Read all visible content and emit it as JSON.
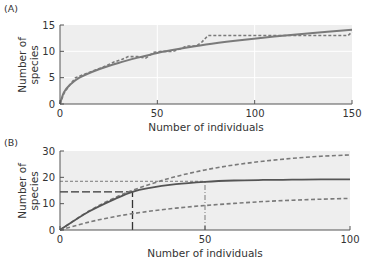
{
  "chart_data": [
    {
      "panel": "(A)",
      "type": "line",
      "xlabel": "Number of individuals",
      "ylabel": [
        "Number of",
        "species"
      ],
      "xlim": [
        0,
        150
      ],
      "ylim": [
        0,
        15
      ],
      "xticks": [
        "0",
        "50",
        "100",
        "150"
      ],
      "yticks": [
        "0",
        "5",
        "10",
        "15"
      ],
      "grid": true,
      "series": [
        {
          "name": "rarefaction curve (solid)",
          "style": "solid",
          "x": [
            0,
            2,
            5,
            10,
            20,
            30,
            40,
            50,
            60,
            75,
            90,
            110,
            130,
            150
          ],
          "y": [
            0,
            2.2,
            3.6,
            5.0,
            6.6,
            7.8,
            8.8,
            9.7,
            10.4,
            11.3,
            12.0,
            12.8,
            13.5,
            14.1
          ]
        },
        {
          "name": "observed accumulation (dashed)",
          "style": "dashed",
          "x": [
            0,
            2,
            5,
            8,
            15,
            22,
            28,
            32,
            35,
            40,
            44,
            48,
            52,
            58,
            62,
            65,
            70,
            73,
            76,
            80,
            100,
            120,
            148,
            150
          ],
          "y": [
            0,
            2.0,
            3.6,
            5.0,
            6.0,
            7.0,
            8.0,
            8.5,
            9.0,
            9.0,
            8.7,
            9.8,
            10.0,
            10.0,
            10.5,
            11.0,
            11.0,
            11.8,
            13.0,
            13.0,
            13.0,
            13.0,
            13.0,
            13.7
          ]
        }
      ]
    },
    {
      "panel": "(B)",
      "type": "line",
      "xlabel": "Number of individuals",
      "ylabel": [
        "Number of",
        "species"
      ],
      "xlim": [
        0,
        100
      ],
      "ylim": [
        0,
        30
      ],
      "xticks": [
        "0",
        "50",
        "100"
      ],
      "yticks": [
        "0",
        "10",
        "20",
        "30"
      ],
      "grid": false,
      "series": [
        {
          "name": "upper curve (dashed)",
          "style": "dashed",
          "x": [
            0,
            10,
            20,
            30,
            40,
            50,
            60,
            70,
            80,
            90,
            100
          ],
          "y": [
            0,
            7.2,
            12.8,
            17.0,
            20.3,
            22.8,
            24.7,
            26.1,
            27.2,
            28.0,
            28.5
          ]
        },
        {
          "name": "middle curve (solid)",
          "style": "solid",
          "x": [
            0,
            10,
            20,
            25,
            30,
            40,
            50,
            60,
            70,
            80,
            90,
            100
          ],
          "y": [
            0,
            7.0,
            12.3,
            14.5,
            15.8,
            17.4,
            18.3,
            18.8,
            19.0,
            19.1,
            19.2,
            19.2
          ]
        },
        {
          "name": "lower curve (dashed)",
          "style": "dashed",
          "x": [
            0,
            10,
            20,
            30,
            40,
            50,
            60,
            70,
            80,
            90,
            100
          ],
          "y": [
            0,
            3.0,
            5.3,
            7.0,
            8.3,
            9.3,
            10.1,
            10.8,
            11.3,
            11.7,
            12.0
          ]
        }
      ],
      "annotations": [
        {
          "type": "hline",
          "style": "long-dash",
          "y": 14.5,
          "x_from": 0,
          "x_to": 25
        },
        {
          "type": "vline",
          "style": "long-dash",
          "x": 25,
          "y_from": 0,
          "y_to": 14.5
        },
        {
          "type": "hline",
          "style": "dashed",
          "y": 18.5,
          "x_from": 0,
          "x_to": 50
        },
        {
          "type": "vline",
          "style": "dash-dot",
          "x": 50,
          "y_from": 0,
          "y_to": 18.5
        }
      ]
    }
  ],
  "panels": {
    "a": {
      "label": "(A)",
      "ylabel_line1": "Number of",
      "ylabel_line2": "species",
      "xlabel": "Number of individuals",
      "xticks": [
        "0",
        "50",
        "100",
        "150"
      ],
      "yticks": [
        "0",
        "5",
        "10",
        "15"
      ]
    },
    "b": {
      "label": "(B)",
      "ylabel_line1": "Number of",
      "ylabel_line2": "species",
      "xlabel": "Number of individuals",
      "xticks": [
        "0",
        "50",
        "100"
      ],
      "yticks": [
        "0",
        "10",
        "20",
        "30"
      ]
    }
  },
  "colors": {
    "plot_bg": "#eeeeee",
    "line": "#7a7a7a",
    "line_dark": "#555555",
    "axis": "#555555",
    "grid": "#ffffff"
  }
}
